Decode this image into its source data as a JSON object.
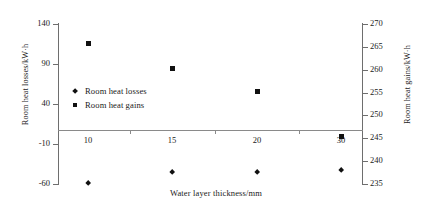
{
  "chart_data": {
    "type": "scatter",
    "title": "",
    "xlabel": "Water layer thickness/mm",
    "categories": [
      "10",
      "15",
      "20",
      "30"
    ],
    "grid": false,
    "legend_position": "inside-left",
    "axes": {
      "left": {
        "label": "Room heat losses/kW·h",
        "ticks": [
          "140",
          "90",
          "40",
          "-10",
          "-60"
        ],
        "tickvalues": [
          140,
          90,
          40,
          -10,
          -60
        ],
        "ylim": [
          -60,
          140
        ]
      },
      "right": {
        "label": "Room heat gains/kW·h",
        "ticks": [
          "270",
          "265",
          "260",
          "255",
          "250",
          "245",
          "240",
          "235"
        ],
        "tickvalues": [
          270,
          265,
          260,
          255,
          250,
          245,
          240,
          235
        ],
        "ylim": [
          235,
          270
        ]
      }
    },
    "series": [
      {
        "name": "Room heat losses",
        "marker": "diamond",
        "axis": "left",
        "color": "#111111",
        "values": [
          -58.8,
          -45.0,
          -45.0,
          -42.5
        ]
      },
      {
        "name": "Room heat gains",
        "marker": "square",
        "axis": "right",
        "color": "#111111",
        "values": [
          265.8,
          260.2,
          255.3,
          245.3
        ]
      }
    ]
  },
  "legend": {
    "items": [
      {
        "label": "Room heat losses",
        "marker": "diamond"
      },
      {
        "label": "Room heat gains",
        "marker": "square"
      }
    ]
  }
}
